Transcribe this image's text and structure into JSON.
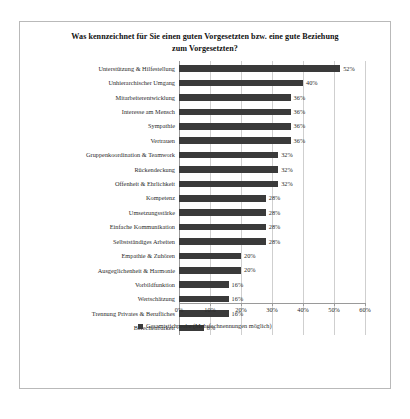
{
  "chart_data": {
    "type": "bar",
    "orientation": "horizontal",
    "title": "Was kennzeichnet für Sie einen guten Vorgesetzten bzw. eine gute Beziehung zum Vorgesetzten?",
    "title_line1": "Was kennzeichnet für Sie einen guten Vorgesetzten bzw. eine gute Beziehung",
    "title_line2": "zum Vorgesetzten?",
    "xlabel": "",
    "ylabel": "",
    "xlim": [
      0,
      60
    ],
    "grid": true,
    "grid_axis": "x",
    "legend_position": "bottom",
    "bar_color": "#3a3a3a",
    "categories": [
      "Unterstützung & Hilfestellung",
      "Unhierarchischer Umgang",
      "Mitarbeiterentwicklung",
      "Interesse am Mensch",
      "Sympathie",
      "Vertrauen",
      "Gruppenkoordination & Teamwork",
      "Rückendeckung",
      "Offenheit & Ehrlichkeit",
      "Kompetenz",
      "Umsetzungsstärke",
      "Einfache Kommunikation",
      "Selbstständiges Arbeiten",
      "Empathie & Zuhören",
      "Ausgeglichenheit & Harmonie",
      "Vorbildfunktion",
      "Wertschätzung",
      "Trennung Privates & Berufliches",
      "Berechenbarkeit"
    ],
    "values": [
      52,
      40,
      36,
      36,
      36,
      36,
      32,
      32,
      32,
      28,
      28,
      28,
      28,
      20,
      20,
      16,
      16,
      16,
      8
    ],
    "value_labels": [
      "52%",
      "40%",
      "36%",
      "36%",
      "36%",
      "36%",
      "32%",
      "32%",
      "32%",
      "28%",
      "28%",
      "28%",
      "28%",
      "20%",
      "20%",
      "16%",
      "16%",
      "16%",
      "8%"
    ],
    "tick_values": [
      0,
      10,
      20,
      30,
      40,
      50,
      60
    ],
    "tick_labels": [
      "0%",
      "10%",
      "20%",
      "30%",
      "40%",
      "50%",
      "60%"
    ],
    "series": [
      {
        "name": "Gesamtstichprobe (Mehrfachnennungen möglich)",
        "values": [
          52,
          40,
          36,
          36,
          36,
          36,
          32,
          32,
          32,
          28,
          28,
          28,
          28,
          20,
          20,
          16,
          16,
          16,
          8
        ]
      }
    ],
    "legend": [
      "Gesamtstichprobe (Mehrfachnennungen möglich)"
    ]
  }
}
